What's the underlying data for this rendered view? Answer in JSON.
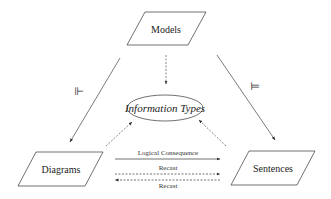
{
  "diagram": {
    "nodes": {
      "models": {
        "label": "Models",
        "shape": "parallelogram"
      },
      "information_types": {
        "label": "Information Types",
        "shape": "ellipse"
      },
      "diagrams": {
        "label": "Diagrams",
        "shape": "parallelogram"
      },
      "sentences": {
        "label": "Sentences",
        "shape": "parallelogram"
      }
    },
    "edges": {
      "models_to_diagrams": {
        "symbol": "⊩",
        "style": "solid"
      },
      "models_to_sentences": {
        "symbol": "⊨",
        "style": "solid"
      },
      "models_to_info": {
        "style": "dashed"
      },
      "diagrams_to_info": {
        "style": "dashed"
      },
      "sentences_to_info": {
        "style": "dashed"
      },
      "logical_consequence": {
        "label": "Logical Consequence",
        "style": "solid"
      },
      "recast_forward": {
        "label": "Recast",
        "style": "dashed"
      },
      "recast_backward": {
        "label": "Recast",
        "style": "dashed"
      }
    }
  }
}
